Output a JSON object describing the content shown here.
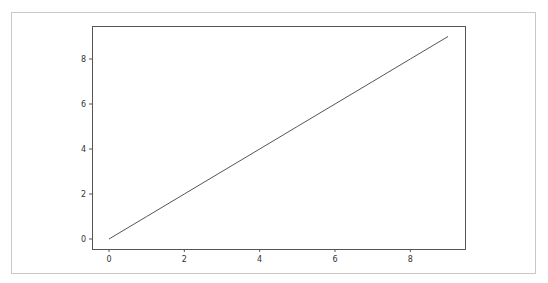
{
  "chart_data": {
    "type": "line",
    "title": "",
    "xlabel": "",
    "ylabel": "",
    "x": [
      0,
      1,
      2,
      3,
      4,
      5,
      6,
      7,
      8,
      9
    ],
    "series": [
      {
        "name": "line",
        "values": [
          0,
          1,
          2,
          3,
          4,
          5,
          6,
          7,
          8,
          9
        ],
        "color": "#555555"
      }
    ],
    "xlim": [
      -0.45,
      9.45
    ],
    "ylim": [
      -0.45,
      9.45
    ],
    "xticks": [
      0,
      2,
      4,
      6,
      8
    ],
    "yticks": [
      0,
      2,
      4,
      6,
      8
    ],
    "xtick_labels": [
      "0",
      "2",
      "4",
      "6",
      "8"
    ],
    "ytick_labels": [
      "0",
      "2",
      "4",
      "6",
      "8"
    ],
    "grid": false,
    "legend": null
  },
  "layout": {
    "axes_px": {
      "left": 92,
      "top": 26,
      "right": 465,
      "bottom": 249
    },
    "x_px": {
      "v0": 109,
      "v9": 448
    },
    "y_px": {
      "v0": 239,
      "v8": 59
    },
    "colors": {
      "axes": "#555555",
      "line": "#555555",
      "frame": "#c8c8c8",
      "text": "#333333"
    }
  }
}
